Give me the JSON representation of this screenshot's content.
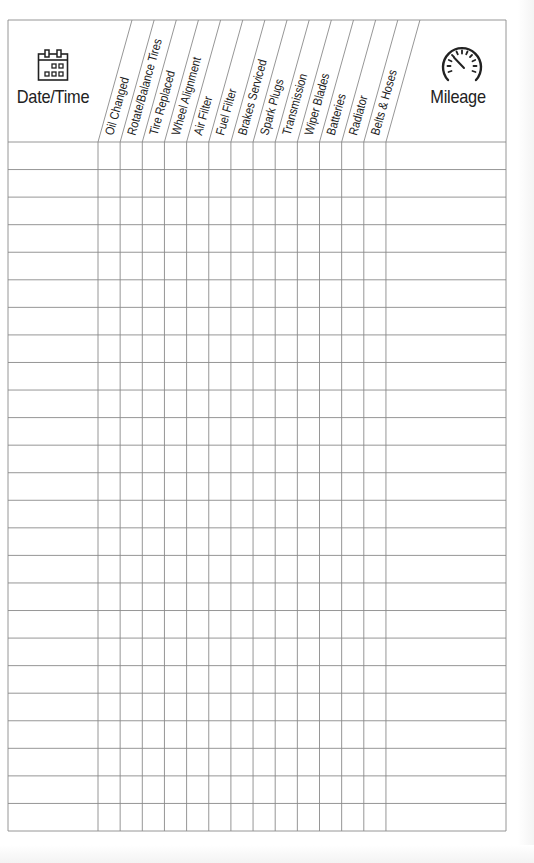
{
  "log": {
    "date_column_label": "Date/Time",
    "mileage_column_label": "Mileage",
    "date_icon": "calendar-icon",
    "mileage_icon": "speedometer-icon",
    "service_columns": [
      "Oil Changed",
      "Rotate/Balance Tires",
      "Tire Replaced",
      "Wheel Alignment",
      "Air Filter",
      "Fuel Filter",
      "Brakes Serviced",
      "Spark Plugs",
      "Transmission",
      "Wiper Blades",
      "Batteries",
      "Radiator",
      "Belts & Hoses"
    ],
    "row_count": 25,
    "line_color": "#8a8a8a",
    "text_color": "#222222"
  }
}
